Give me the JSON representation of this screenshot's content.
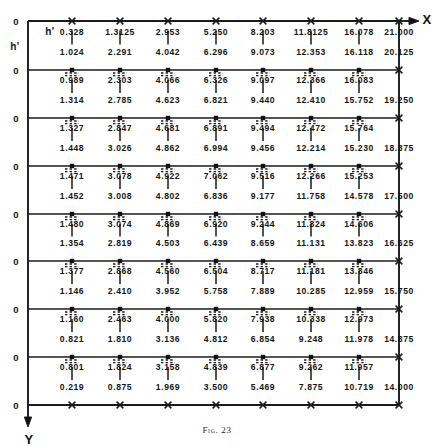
{
  "figure": {
    "caption": "Fig. 23",
    "axis_x_label": "X",
    "axis_y_label": "Y",
    "h_label_top": "h'",
    "h_label_left": "h'",
    "origin_label": "0",
    "origin_count": 9
  },
  "chart_data": {
    "type": "table",
    "title": "Fig. 23",
    "xlabel": "X",
    "ylabel": "Y",
    "grid": true,
    "legend": "none",
    "columns": 8,
    "grid_lines": 9,
    "column_x_px": [
      72,
      120,
      168,
      216,
      263,
      311,
      359,
      399
    ],
    "row_line_y_px": [
      21,
      70,
      118,
      166,
      214,
      261,
      309,
      357,
      405
    ],
    "rows": [
      {
        "band": 0,
        "upper": [
          "0.328",
          "1.3125",
          "2.953",
          "5.250",
          "8.203",
          "11.8125",
          "16.078",
          "21.000"
        ],
        "lower": [
          "1.024",
          "2.291",
          "4.042",
          "6.296",
          "9.073",
          "12.353",
          "16.118",
          "20.125"
        ]
      },
      {
        "band": 1,
        "upper": [
          "0.989",
          "2.303",
          "4.066",
          "6.326",
          "9.097",
          "12.366",
          "16.083"
        ],
        "lower": [
          "1.314",
          "2.785",
          "4.623",
          "6.821",
          "9.440",
          "12.410",
          "15.752",
          "19.250"
        ]
      },
      {
        "band": 2,
        "upper": [
          "1.327",
          "2.847",
          "4.681",
          "6.891",
          "9.494",
          "12.472",
          "15.764"
        ],
        "lower": [
          "1.448",
          "3.026",
          "4.862",
          "6.994",
          "9.456",
          "12.214",
          "15.230",
          "18.375"
        ]
      },
      {
        "band": 3,
        "upper": [
          "1.471",
          "3.078",
          "4.922",
          "7.062",
          "9.516",
          "12.266",
          "15.253"
        ],
        "lower": [
          "1.452",
          "3.008",
          "4.802",
          "6.836",
          "9.177",
          "11.758",
          "14.578",
          "17.500"
        ]
      },
      {
        "band": 4,
        "upper": [
          "1.480",
          "3.074",
          "4.869",
          "6.920",
          "9.244",
          "11.824",
          "14.606"
        ],
        "lower": [
          "1.354",
          "2.819",
          "4.503",
          "6.439",
          "8.659",
          "11.131",
          "13.823",
          "16.625"
        ]
      },
      {
        "band": 5,
        "upper": [
          "1.377",
          "2.868",
          "4.560",
          "6.504",
          "8.717",
          "11.181",
          "13.846"
        ],
        "lower": [
          "1.146",
          "2.410",
          "3.952",
          "5.758",
          "7.889",
          "10.285",
          "12.959",
          "15.750"
        ]
      },
      {
        "band": 6,
        "upper": [
          "1.160",
          "2.463",
          "4.000",
          "5.820",
          "7.938",
          "10.338",
          "12.973"
        ],
        "lower": [
          "0.821",
          "1.810",
          "3.136",
          "4.812",
          "6.854",
          "9.248",
          "11.978",
          "14.875"
        ]
      },
      {
        "band": 7,
        "upper": [
          "0.801",
          "1.824",
          "3.158",
          "4.839",
          "6.877",
          "9.262",
          "11.957"
        ],
        "lower": [
          "0.219",
          "0.875",
          "1.969",
          "3.500",
          "5.469",
          "7.875",
          "10.719",
          "14.000"
        ]
      }
    ]
  }
}
